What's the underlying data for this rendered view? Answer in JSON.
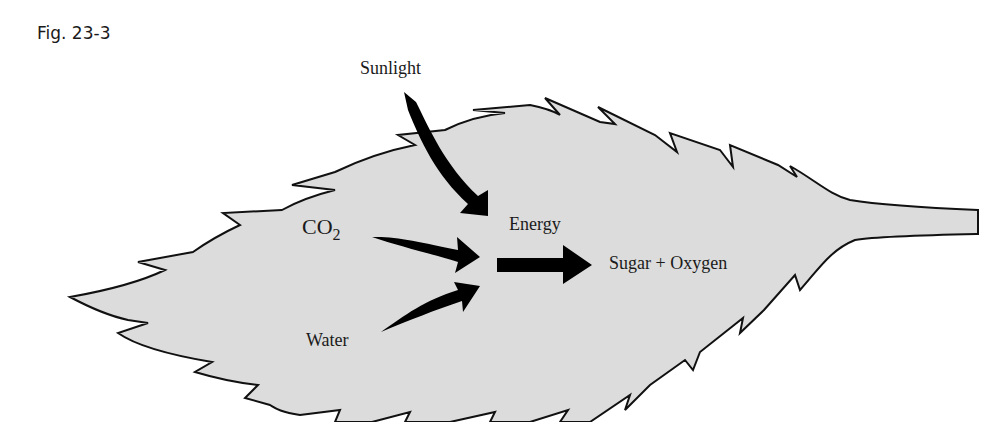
{
  "figure": {
    "label": "Fig. 23-3"
  },
  "diagram": {
    "labels": {
      "sunlight": "Sunlight",
      "co2_main": "CO",
      "co2_sub": "2",
      "water": "Water",
      "energy": "Energy",
      "products": "Sugar + Oxygen"
    },
    "colors": {
      "leaf_fill": "#dcdcdc",
      "outline": "#111111",
      "arrow": "#000000",
      "text": "#1a1a1a"
    },
    "arrows": [
      {
        "from": "Sunlight",
        "to": "center"
      },
      {
        "from": "CO2",
        "to": "center"
      },
      {
        "from": "Water",
        "to": "center"
      },
      {
        "from": "center",
        "to": "Sugar + Oxygen"
      }
    ]
  }
}
